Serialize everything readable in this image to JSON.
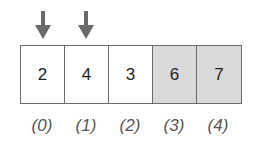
{
  "arrows": [
    {
      "index": 0,
      "icon": "down-arrow-icon",
      "color": "#6a6a6a"
    },
    {
      "index": 1,
      "icon": "down-arrow-icon",
      "color": "#6a6a6a"
    }
  ],
  "cells": [
    {
      "value": "2",
      "shaded": false
    },
    {
      "value": "4",
      "shaded": false
    },
    {
      "value": "3",
      "shaded": false
    },
    {
      "value": "6",
      "shaded": true
    },
    {
      "value": "7",
      "shaded": true
    }
  ],
  "indices": [
    "(0)",
    "(1)",
    "(2)",
    "(3)",
    "(4)"
  ],
  "colors": {
    "shade": "#d9d9d9",
    "border": "#6a6a6a"
  }
}
